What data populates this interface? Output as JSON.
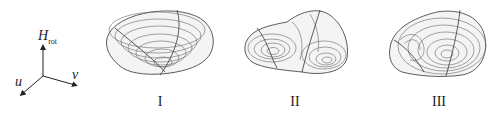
{
  "axes": {
    "vertical_label": "H",
    "vertical_subscript": "rot",
    "left_label": "u",
    "right_label": "v"
  },
  "panels": [
    {
      "id": "I",
      "label": "I",
      "description": "single-well bowl surface"
    },
    {
      "id": "II",
      "label": "II",
      "description": "double-well surface"
    },
    {
      "id": "III",
      "label": "III",
      "description": "ring-shaped well with central bump"
    }
  ],
  "colors": {
    "line": "#555555",
    "surface": "#f4f4f4",
    "edge": "#333333",
    "text": "#222222"
  }
}
